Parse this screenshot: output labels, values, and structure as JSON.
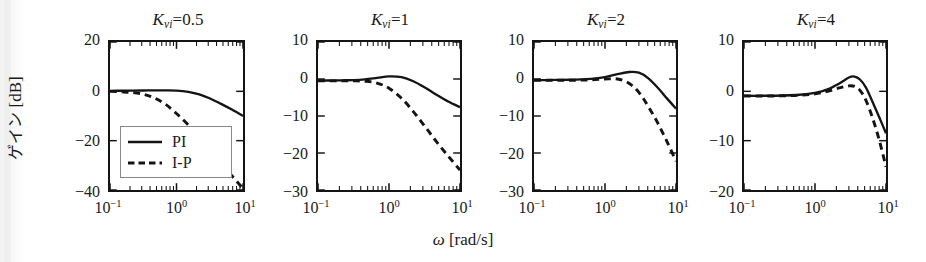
{
  "figure": {
    "xlabel_symbol": "ω",
    "xlabel_unit": "[rad/s]",
    "ylabel_jp": "ゲイン",
    "ylabel_unit": "[dB]",
    "legend": {
      "solid_label": "PI",
      "dashed_label": "I-P"
    },
    "line_color": "#141414"
  },
  "chart_data": [
    {
      "type": "line",
      "title": "K_vi=0.5",
      "title_base": "K",
      "title_sub": "vi",
      "title_value": "0.5",
      "xlabel": "ω [rad/s]",
      "ylabel": "ゲイン [dB]",
      "xscale": "log",
      "xlim": [
        0.1,
        10
      ],
      "ylim": [
        -40,
        20
      ],
      "xticks": [
        0.1,
        1,
        10
      ],
      "xticklabels": [
        "10⁻¹",
        "10⁰",
        "10¹"
      ],
      "yticks": [
        20,
        0,
        -20,
        -40
      ],
      "yticklabels": [
        "20",
        "0",
        "-20",
        "-40"
      ],
      "grid": false,
      "legend_position": "lower left",
      "series": [
        {
          "name": "PI",
          "style": "solid",
          "x": [
            0.1,
            0.15,
            0.22,
            0.32,
            0.46,
            0.68,
            1.0,
            1.5,
            2.2,
            3.2,
            4.6,
            6.8,
            10.0
          ],
          "y": [
            0.2,
            0.25,
            0.3,
            0.35,
            0.4,
            0.4,
            0.3,
            -0.2,
            -1.2,
            -2.9,
            -5.0,
            -7.4,
            -10.0
          ]
        },
        {
          "name": "I-P",
          "style": "dashed",
          "x": [
            0.1,
            0.15,
            0.22,
            0.32,
            0.46,
            0.68,
            1.0,
            1.5,
            2.2,
            3.2,
            4.6,
            6.8,
            10.0
          ],
          "y": [
            0.0,
            -0.2,
            -0.5,
            -1.2,
            -2.6,
            -5.2,
            -9.0,
            -13.6,
            -18.6,
            -23.8,
            -29.0,
            -34.2,
            -39.4
          ]
        }
      ]
    },
    {
      "type": "line",
      "title": "K_vi=1",
      "title_base": "K",
      "title_sub": "vi",
      "title_value": "1",
      "xlabel": "ω [rad/s]",
      "ylabel": "",
      "xscale": "log",
      "xlim": [
        0.1,
        10
      ],
      "ylim": [
        -30,
        10
      ],
      "xticks": [
        0.1,
        1,
        10
      ],
      "xticklabels": [
        "10⁻¹",
        "10⁰",
        "10¹"
      ],
      "yticks": [
        10,
        0,
        -10,
        -20,
        -30
      ],
      "yticklabels": [
        "10",
        "0",
        "-10",
        "-20",
        "-30"
      ],
      "grid": false,
      "legend_position": "none",
      "series": [
        {
          "name": "PI",
          "style": "solid",
          "x": [
            0.1,
            0.15,
            0.22,
            0.32,
            0.46,
            0.68,
            1.0,
            1.5,
            2.2,
            3.2,
            4.6,
            6.8,
            10.0
          ],
          "y": [
            -0.4,
            -0.4,
            -0.35,
            -0.3,
            -0.1,
            0.3,
            0.7,
            0.5,
            -0.6,
            -2.3,
            -4.2,
            -6.1,
            -7.6
          ]
        },
        {
          "name": "I-P",
          "style": "dashed",
          "x": [
            0.1,
            0.15,
            0.22,
            0.32,
            0.46,
            0.68,
            1.0,
            1.5,
            2.2,
            3.2,
            4.6,
            6.8,
            10.0
          ],
          "y": [
            -0.5,
            -0.5,
            -0.5,
            -0.5,
            -0.6,
            -1.1,
            -2.5,
            -5.2,
            -8.8,
            -12.8,
            -16.8,
            -20.8,
            -24.6
          ]
        }
      ]
    },
    {
      "type": "line",
      "title": "K_vi=2",
      "title_base": "K",
      "title_sub": "vi",
      "title_value": "2",
      "xlabel": "ω [rad/s]",
      "ylabel": "",
      "xscale": "log",
      "xlim": [
        0.1,
        10
      ],
      "ylim": [
        -30,
        10
      ],
      "xticks": [
        0.1,
        1,
        10
      ],
      "xticklabels": [
        "10⁻¹",
        "10⁰",
        "10¹"
      ],
      "yticks": [
        10,
        0,
        -10,
        -20,
        -30
      ],
      "yticklabels": [
        "10",
        "0",
        "-10",
        "-20",
        "-30"
      ],
      "grid": false,
      "legend_position": "none",
      "series": [
        {
          "name": "PI",
          "style": "solid",
          "x": [
            0.1,
            0.15,
            0.22,
            0.32,
            0.46,
            0.68,
            1.0,
            1.5,
            2.2,
            3.0,
            4.0,
            5.5,
            7.5,
            10.0
          ],
          "y": [
            -0.3,
            -0.3,
            -0.25,
            -0.2,
            -0.1,
            0.1,
            0.5,
            1.3,
            1.9,
            1.7,
            0.3,
            -2.3,
            -5.3,
            -8.0
          ]
        },
        {
          "name": "I-P",
          "style": "dashed",
          "x": [
            0.1,
            0.15,
            0.22,
            0.32,
            0.46,
            0.68,
            1.0,
            1.5,
            2.2,
            3.0,
            4.0,
            5.5,
            7.5,
            10.0
          ],
          "y": [
            -0.35,
            -0.35,
            -0.35,
            -0.35,
            -0.3,
            -0.2,
            0.0,
            0.0,
            -1.2,
            -3.6,
            -7.2,
            -11.8,
            -17.0,
            -22.2
          ]
        }
      ]
    },
    {
      "type": "line",
      "title": "K_vi=4",
      "title_base": "K",
      "title_sub": "vi",
      "title_value": "4",
      "xlabel": "ω [rad/s]",
      "ylabel": "",
      "xscale": "log",
      "xlim": [
        0.1,
        10
      ],
      "ylim": [
        -20,
        10
      ],
      "xticks": [
        0.1,
        1,
        10
      ],
      "xticklabels": [
        "10⁻¹",
        "10⁰",
        "10¹"
      ],
      "yticks": [
        10,
        0,
        -10,
        -20
      ],
      "yticklabels": [
        "10",
        "0",
        "-10",
        "-20"
      ],
      "grid": false,
      "legend_position": "none",
      "series": [
        {
          "name": "PI",
          "style": "solid",
          "x": [
            0.1,
            0.2,
            0.35,
            0.6,
            1.0,
            1.5,
            2.2,
            3.0,
            3.6,
            4.3,
            5.2,
            6.4,
            8.0,
            10.0
          ],
          "y": [
            -0.9,
            -0.9,
            -0.85,
            -0.7,
            -0.3,
            0.4,
            1.6,
            2.8,
            3.0,
            2.4,
            0.8,
            -2.0,
            -5.2,
            -8.5
          ]
        },
        {
          "name": "I-P",
          "style": "dashed",
          "x": [
            0.1,
            0.2,
            0.35,
            0.6,
            1.0,
            1.5,
            2.2,
            3.0,
            3.6,
            4.3,
            5.2,
            6.4,
            8.0,
            10.0
          ],
          "y": [
            -0.95,
            -0.95,
            -0.9,
            -0.8,
            -0.5,
            0.0,
            0.7,
            1.1,
            1.0,
            0.2,
            -1.8,
            -5.2,
            -9.8,
            -15.3
          ]
        }
      ]
    }
  ]
}
